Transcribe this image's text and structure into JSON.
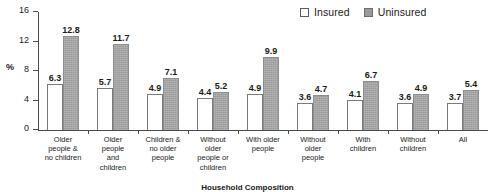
{
  "chart_data": {
    "type": "bar",
    "title": "",
    "xlabel": "Household Composition",
    "ylabel": "%",
    "ylim": [
      0,
      16
    ],
    "yticks": [
      0,
      4,
      8,
      12,
      16
    ],
    "grid": false,
    "legend_position": "top-right",
    "categories": [
      "Older people & no children",
      "Older people and children",
      "Children & no older people",
      "Without older people or children",
      "With older people",
      "Without older people",
      "With children",
      "Without children",
      "All"
    ],
    "category_lines": [
      [
        "Older",
        "people &",
        "no children"
      ],
      [
        "Older",
        "people",
        "and",
        "children"
      ],
      [
        "Children &",
        "no older",
        "people"
      ],
      [
        "Without",
        "older",
        "people  or",
        "children"
      ],
      [
        "With older",
        "people"
      ],
      [
        "Without",
        "older",
        "people"
      ],
      [
        "With",
        "children"
      ],
      [
        "Without",
        "children"
      ],
      [
        "All"
      ]
    ],
    "series": [
      {
        "name": "Insured",
        "color": "#ffffff",
        "values": [
          6.3,
          5.7,
          4.9,
          4.4,
          4.9,
          3.6,
          4.1,
          3.6,
          3.7
        ]
      },
      {
        "name": "Uninsured",
        "color": "#9a9a9a",
        "values": [
          12.8,
          11.7,
          7.1,
          5.2,
          9.9,
          4.7,
          6.7,
          4.9,
          5.4
        ]
      }
    ]
  },
  "legend": {
    "entries": [
      {
        "label": "Insured",
        "swatch": "open-square"
      },
      {
        "label": "Uninsured",
        "swatch": "filled-square"
      }
    ]
  },
  "axes": {
    "y_title": "%",
    "y_tick_labels": [
      "0",
      "4",
      "8",
      "12",
      "16"
    ],
    "x_title": "Household Composition"
  }
}
